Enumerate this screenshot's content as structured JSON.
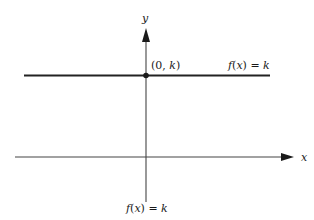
{
  "figure": {
    "axes": {
      "x_label": "x",
      "y_label": "y"
    },
    "point": {
      "label_open": "(0, ",
      "label_var": "k",
      "label_close": ")"
    },
    "line_label_right": {
      "f": "f",
      "paren_open": "(",
      "var": "x",
      "paren_close": ")",
      "equals": " = ",
      "k": "k"
    },
    "caption": {
      "f": "f",
      "paren_open": "(",
      "var": "x",
      "paren_close": ")",
      "equals": " = ",
      "k": "k"
    },
    "colors": {
      "ink": "#1a1a1a",
      "constant_line": "#222222",
      "axis": "#444444"
    }
  }
}
